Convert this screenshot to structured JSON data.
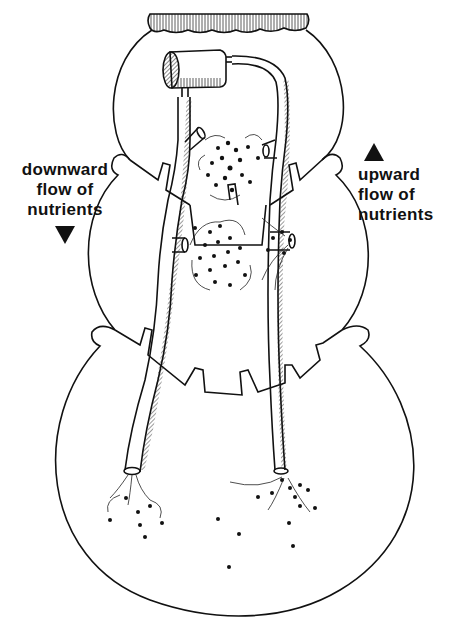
{
  "labels": {
    "downward": {
      "lines": [
        "downward",
        "flow of",
        "nutrients"
      ],
      "arrow": "down-triangle"
    },
    "upward": {
      "lines": [
        "upward",
        "flow of",
        "nutrients"
      ],
      "arrow": "up-triangle"
    }
  },
  "colors": {
    "ink": "#111111",
    "background": "#ffffff"
  }
}
